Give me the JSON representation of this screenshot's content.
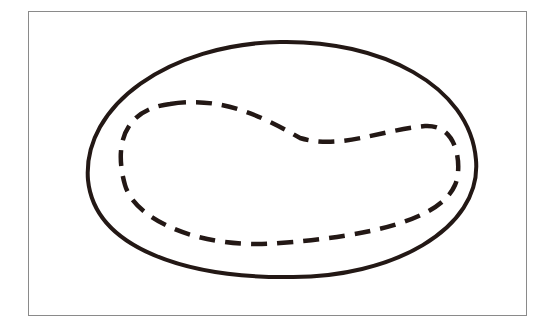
{
  "diagram": {
    "colors": {
      "frame": "#8a8a8a",
      "stroke": "#231815",
      "background": "#ffffff"
    },
    "shapes": [
      {
        "id": "outer-boundary",
        "style": "solid"
      },
      {
        "id": "inner-region",
        "style": "dashed"
      }
    ]
  }
}
